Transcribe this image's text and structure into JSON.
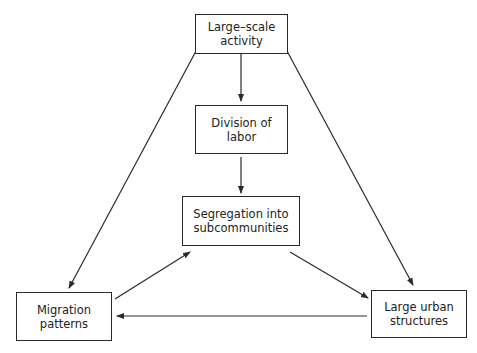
{
  "nodes": {
    "large_scale_activity": {
      "label": "Large–scale\nactivity"
    },
    "division_of_labor": {
      "label": "Division of\nlabor"
    },
    "segregation": {
      "label": "Segregation into\nsubcommunities"
    },
    "migration": {
      "label": "Migration\npatterns"
    },
    "urban_structures": {
      "label": "Large urban\nstructures"
    }
  },
  "edges": [
    {
      "from": "large_scale_activity",
      "to": "division_of_labor"
    },
    {
      "from": "division_of_labor",
      "to": "segregation"
    },
    {
      "from": "large_scale_activity",
      "to": "migration"
    },
    {
      "from": "large_scale_activity",
      "to": "urban_structures"
    },
    {
      "from": "migration",
      "to": "segregation"
    },
    {
      "from": "segregation",
      "to": "urban_structures"
    },
    {
      "from": "urban_structures",
      "to": "migration"
    }
  ],
  "colors": {
    "line": "#2a2a2a",
    "text": "#222222",
    "background": "#ffffff"
  }
}
